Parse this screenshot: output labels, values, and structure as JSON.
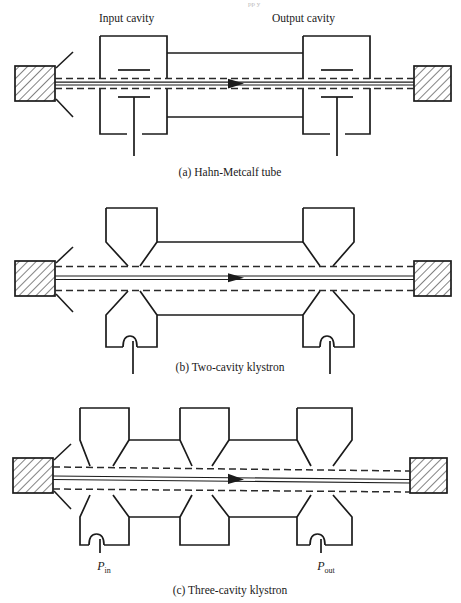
{
  "figure": {
    "page_width": 461,
    "page_height": 603,
    "background_color": "#ffffff",
    "ink_color": "#1b1b1b",
    "cropped_header_text": "pp                                  y",
    "panels": [
      {
        "id": "a",
        "caption": "(a)  Hahn-Metcalf tube",
        "cavity_style": "rectangular",
        "labels": {
          "input_cavity": "Input cavity",
          "output_cavity": "Output cavity"
        },
        "cavity_count": 2,
        "has_coupling_loops": false,
        "has_grid_bars": true
      },
      {
        "id": "b",
        "caption": "(b)  Two-cavity klystron",
        "cavity_style": "reentrant-funnel",
        "cavity_count": 2,
        "has_coupling_loops": true,
        "has_grid_bars": false
      },
      {
        "id": "c",
        "caption": "(c)  Three-cavity klystron",
        "cavity_style": "reentrant-funnel",
        "cavity_count": 3,
        "has_coupling_loops": true,
        "power_in_label": "P",
        "power_in_sub": "in",
        "power_out_label": "P",
        "power_out_sub": "out"
      }
    ],
    "components": {
      "cathode": "hatched-block-left",
      "collector": "hatched-block-right",
      "beam": "dashed-envelope-with-solid-axis-and-arrow",
      "beam_direction": "left-to-right"
    }
  }
}
